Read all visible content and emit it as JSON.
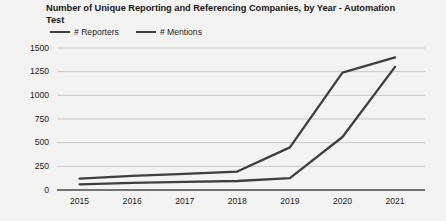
{
  "chart_data": {
    "type": "line",
    "title": "Number of Unique Reporting and Referencing Companies, by Year - Automation Test",
    "xlabel": "",
    "ylabel": "",
    "categories": [
      "2015",
      "2016",
      "2017",
      "2018",
      "2019",
      "2020",
      "2021"
    ],
    "series": [
      {
        "name": "# Reporters",
        "color": "#3f3f3f",
        "values": [
          60,
          75,
          85,
          95,
          125,
          560,
          1300
        ]
      },
      {
        "name": "# Mentions",
        "color": "#3f3f3f",
        "values": [
          120,
          150,
          170,
          195,
          450,
          1240,
          1400
        ]
      }
    ],
    "ylim": [
      0,
      1500
    ],
    "yticks": [
      "0",
      "250",
      "500",
      "750",
      "1000",
      "1250",
      "1500"
    ],
    "ytick_values": [
      0,
      250,
      500,
      750,
      1000,
      1250,
      1500
    ],
    "grid": true,
    "legend_position": "top-left",
    "background_color": "#f3f3f1",
    "gridline_color": "#c9c9c7",
    "axis_color": "#4a4a4a"
  },
  "legend": {
    "entries": [
      {
        "label": "# Reporters"
      },
      {
        "label": "# Mentions"
      }
    ]
  }
}
